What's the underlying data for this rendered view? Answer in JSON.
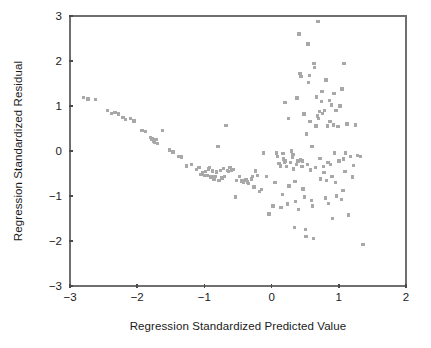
{
  "chart_data": {
    "type": "scatter",
    "title": "",
    "xlabel": "Regression Standardized Predicted Value",
    "ylabel": "Regression Standardized Residual",
    "xlim": [
      -3,
      2
    ],
    "ylim": [
      -3,
      3
    ],
    "xticks": [
      -3,
      -2,
      -1,
      0,
      1,
      2
    ],
    "yticks": [
      -3,
      -2,
      -1,
      0,
      1,
      2,
      3
    ],
    "xtick_labels": [
      "−3",
      "−2",
      "−1",
      "0",
      "1",
      "2"
    ],
    "ytick_labels": [
      "−3",
      "−2",
      "−1",
      "0",
      "1",
      "2",
      "3"
    ],
    "grid": false,
    "legend": null,
    "marker": {
      "shape": "square",
      "color": "#a8a8a8",
      "size_px": 3.4
    },
    "frame_color": "#6f6f6f",
    "text_color": "#1a1a1a",
    "background": "#ffffff",
    "n_points": 176,
    "points": [
      [
        -2.8,
        1.19
      ],
      [
        -2.73,
        1.16
      ],
      [
        -2.62,
        1.15
      ],
      [
        -2.44,
        0.9
      ],
      [
        -2.38,
        0.83
      ],
      [
        -2.33,
        0.86
      ],
      [
        -2.28,
        0.82
      ],
      [
        -2.21,
        0.74
      ],
      [
        -2.17,
        0.7
      ],
      [
        -2.1,
        0.72
      ],
      [
        -2.05,
        0.67
      ],
      [
        -1.93,
        0.45
      ],
      [
        -1.88,
        0.43
      ],
      [
        -1.8,
        0.3
      ],
      [
        -1.78,
        0.27
      ],
      [
        -1.76,
        0.22
      ],
      [
        -1.74,
        0.19
      ],
      [
        -1.72,
        0.25
      ],
      [
        -1.7,
        0.17
      ],
      [
        -1.62,
        0.46
      ],
      [
        -1.52,
        0.02
      ],
      [
        -1.47,
        -0.02
      ],
      [
        -1.38,
        -0.12
      ],
      [
        -1.34,
        -0.13
      ],
      [
        -1.27,
        -0.33
      ],
      [
        -1.19,
        -0.3
      ],
      [
        -1.12,
        -0.41
      ],
      [
        -1.08,
        -0.36
      ],
      [
        -1.05,
        -0.52
      ],
      [
        -1.03,
        -0.49
      ],
      [
        -1.0,
        -0.55
      ],
      [
        -0.98,
        -0.45
      ],
      [
        -0.96,
        -0.54
      ],
      [
        -0.94,
        -0.4
      ],
      [
        -0.92,
        -0.37
      ],
      [
        -0.9,
        -0.58
      ],
      [
        -0.88,
        -0.44
      ],
      [
        -0.86,
        -0.62
      ],
      [
        -0.84,
        -0.57
      ],
      [
        -0.82,
        -0.47
      ],
      [
        -0.8,
        0.1
      ],
      [
        -0.78,
        -0.66
      ],
      [
        -0.76,
        -0.43
      ],
      [
        -0.74,
        -0.6
      ],
      [
        -0.72,
        -0.39
      ],
      [
        -0.7,
        -0.56
      ],
      [
        -0.68,
        0.57
      ],
      [
        -0.66,
        -0.43
      ],
      [
        -0.64,
        -0.46
      ],
      [
        -0.62,
        -0.37
      ],
      [
        -0.6,
        -0.42
      ],
      [
        -0.57,
        -0.41
      ],
      [
        -0.54,
        -1.02
      ],
      [
        -0.52,
        -0.66
      ],
      [
        -0.48,
        -0.57
      ],
      [
        -0.44,
        -0.67
      ],
      [
        -0.42,
        -0.7
      ],
      [
        -0.4,
        -0.66
      ],
      [
        -0.38,
        -0.63
      ],
      [
        -0.36,
        -0.69
      ],
      [
        -0.34,
        -0.72
      ],
      [
        -0.3,
        -0.62
      ],
      [
        -0.28,
        -0.57
      ],
      [
        -0.26,
        -0.8
      ],
      [
        -0.24,
        -0.44
      ],
      [
        -0.21,
        -0.55
      ],
      [
        -0.18,
        -0.9
      ],
      [
        -0.15,
        -0.86
      ],
      [
        -0.12,
        -0.04
      ],
      [
        -0.08,
        -0.56
      ],
      [
        -0.04,
        -1.4
      ],
      [
        0.02,
        -1.22
      ],
      [
        0.05,
        -0.7
      ],
      [
        0.07,
        -0.04
      ],
      [
        0.09,
        -0.12
      ],
      [
        0.11,
        -0.28
      ],
      [
        0.13,
        -0.33
      ],
      [
        0.14,
        -1.26
      ],
      [
        0.16,
        -0.96
      ],
      [
        0.17,
        -0.05
      ],
      [
        0.18,
        -0.18
      ],
      [
        0.19,
        -0.24
      ],
      [
        0.2,
        1.08
      ],
      [
        0.21,
        -0.22
      ],
      [
        0.22,
        -0.35
      ],
      [
        0.24,
        -1.18
      ],
      [
        0.25,
        0.72
      ],
      [
        0.26,
        -0.78
      ],
      [
        0.28,
        -0.25
      ],
      [
        0.3,
        0.0
      ],
      [
        0.31,
        -0.14
      ],
      [
        0.32,
        -0.08
      ],
      [
        0.33,
        -0.4
      ],
      [
        0.34,
        -1.7
      ],
      [
        0.35,
        -0.68
      ],
      [
        0.36,
        -1.12
      ],
      [
        0.37,
        -0.3
      ],
      [
        0.38,
        1.18
      ],
      [
        0.39,
        -0.22
      ],
      [
        0.4,
        -1.3
      ],
      [
        0.41,
        2.6
      ],
      [
        0.42,
        1.72
      ],
      [
        0.43,
        -0.2
      ],
      [
        0.44,
        1.66
      ],
      [
        0.45,
        -0.34
      ],
      [
        0.46,
        -0.22
      ],
      [
        0.47,
        -0.84
      ],
      [
        0.48,
        0.82
      ],
      [
        0.49,
        -1.02
      ],
      [
        0.5,
        -1.75
      ],
      [
        0.51,
        -1.9
      ],
      [
        0.52,
        0.38
      ],
      [
        0.53,
        -0.3
      ],
      [
        0.54,
        2.38
      ],
      [
        0.55,
        1.52
      ],
      [
        0.56,
        1.68
      ],
      [
        0.57,
        0.66
      ],
      [
        0.58,
        -0.42
      ],
      [
        0.59,
        -1.1
      ],
      [
        0.6,
        0.1
      ],
      [
        0.61,
        -1.22
      ],
      [
        0.62,
        -1.94
      ],
      [
        0.63,
        1.95
      ],
      [
        0.64,
        1.86
      ],
      [
        0.65,
        -0.36
      ],
      [
        0.66,
        0.56
      ],
      [
        0.67,
        1.2
      ],
      [
        0.68,
        0.78
      ],
      [
        0.69,
        2.88
      ],
      [
        0.7,
        0.72
      ],
      [
        0.71,
        0.88
      ],
      [
        0.72,
        -0.16
      ],
      [
        0.73,
        -0.62
      ],
      [
        0.74,
        1.1
      ],
      [
        0.75,
        1.32
      ],
      [
        0.76,
        0.84
      ],
      [
        0.77,
        -0.34
      ],
      [
        0.78,
        -0.48
      ],
      [
        0.79,
        0.9
      ],
      [
        0.8,
        -1.04
      ],
      [
        0.81,
        1.58
      ],
      [
        0.82,
        -0.66
      ],
      [
        0.83,
        0.56
      ],
      [
        0.84,
        -0.26
      ],
      [
        0.85,
        -1.16
      ],
      [
        0.86,
        1.12
      ],
      [
        0.87,
        0.66
      ],
      [
        0.88,
        -0.3
      ],
      [
        0.89,
        1.02
      ],
      [
        0.9,
        -0.56
      ],
      [
        0.91,
        -1.5
      ],
      [
        0.92,
        0.58
      ],
      [
        0.93,
        1.28
      ],
      [
        0.94,
        -0.04
      ],
      [
        0.95,
        -0.7
      ],
      [
        0.96,
        0.9
      ],
      [
        0.97,
        -1.0
      ],
      [
        0.99,
        0.54
      ],
      [
        1.0,
        -0.22
      ],
      [
        1.02,
        1.0
      ],
      [
        1.04,
        -1.08
      ],
      [
        1.05,
        1.38
      ],
      [
        1.06,
        -0.88
      ],
      [
        1.07,
        -0.18
      ],
      [
        1.08,
        1.94
      ],
      [
        1.09,
        -0.46
      ],
      [
        1.1,
        -0.04
      ],
      [
        1.12,
        0.6
      ],
      [
        1.14,
        -1.42
      ],
      [
        1.17,
        -0.12
      ],
      [
        1.2,
        -0.58
      ],
      [
        1.22,
        -0.32
      ],
      [
        1.25,
        0.58
      ],
      [
        1.28,
        -0.1
      ],
      [
        1.32,
        -0.12
      ],
      [
        1.36,
        -2.08
      ]
    ]
  },
  "axes": {
    "x_axis_name": "x-axis",
    "y_axis_name": "y-axis"
  }
}
